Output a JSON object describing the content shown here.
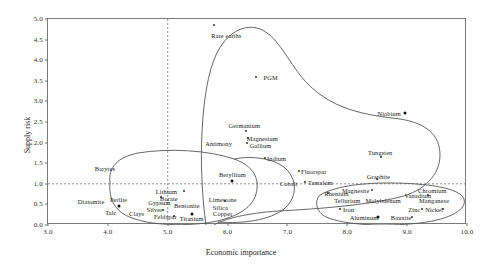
{
  "chart_data": {
    "type": "scatter",
    "title": "",
    "xlabel": "Economic importance",
    "ylabel": "Supply risk",
    "xlim": [
      3.0,
      10.0
    ],
    "ylim": [
      0.0,
      5.0
    ],
    "xticks": [
      "3.0",
      "4.0",
      "5.0",
      "6.0",
      "7.0",
      "8.0",
      "9.0",
      "10.0"
    ],
    "yticks": [
      "0.0",
      "0.5",
      "1.0",
      "1.5",
      "2.0",
      "2.5",
      "3.0",
      "3.5",
      "4.0",
      "4.5",
      "5.0"
    ],
    "grid": false,
    "legend": "none",
    "reference_lines": [
      {
        "name": "vertical-threshold",
        "axis": "x",
        "value": 5.0,
        "style": "dashed"
      },
      {
        "name": "horizontal-threshold",
        "axis": "y",
        "value": 1.0,
        "style": "dashed"
      }
    ],
    "points": [
      {
        "label": "Rare earths",
        "x": 5.78,
        "y": 4.85,
        "lx": 5.98,
        "ly": 4.6
      },
      {
        "label": "PGM",
        "x": 6.5,
        "y": 3.6,
        "lx": 6.72,
        "ly": 3.6
      },
      {
        "label": "Niobium",
        "x": 8.97,
        "y": 2.72,
        "lx": 8.7,
        "ly": 2.72
      },
      {
        "label": "Germanium",
        "x": 6.28,
        "y": 2.32,
        "lx": 6.28,
        "ly": 2.42
      },
      {
        "label": "Magnesium",
        "x": 6.35,
        "y": 2.12,
        "lx": 6.58,
        "ly": 2.12
      },
      {
        "label": "Gallium",
        "x": 6.32,
        "y": 1.97,
        "lx": 6.55,
        "ly": 1.94
      },
      {
        "label": "Antimony",
        "x": 5.95,
        "y": 1.98,
        "lx": 5.85,
        "ly": 1.98
      },
      {
        "label": "Indium",
        "x": 6.62,
        "y": 1.62,
        "lx": 6.82,
        "ly": 1.62
      },
      {
        "label": "Tungsten",
        "x": 8.55,
        "y": 1.72,
        "lx": 8.55,
        "ly": 1.78
      },
      {
        "label": "Fluorspar",
        "x": 7.22,
        "y": 1.32,
        "lx": 7.44,
        "ly": 1.32
      },
      {
        "label": "Beryllium",
        "x": 6.08,
        "y": 1.1,
        "lx": 6.08,
        "ly": 1.24
      },
      {
        "label": "Cobalt",
        "x": 7.08,
        "y": 1.02,
        "lx": 7.02,
        "ly": 1.02
      },
      {
        "label": "Tantalum",
        "x": 7.45,
        "y": 1.04,
        "lx": 7.55,
        "ly": 1.04
      },
      {
        "label": "Graphite",
        "x": 8.5,
        "y": 1.2,
        "lx": 8.52,
        "ly": 1.2
      },
      {
        "label": "Barytes",
        "x": 3.95,
        "y": 1.38,
        "lx": 3.95,
        "ly": 1.38
      },
      {
        "label": "Diatomite",
        "x": 3.72,
        "y": 0.58,
        "lx": 3.72,
        "ly": 0.58
      },
      {
        "label": "Perlite",
        "x": 4.18,
        "y": 0.52,
        "lx": 4.18,
        "ly": 0.62
      },
      {
        "label": "Talc",
        "x": 4.05,
        "y": 0.32,
        "lx": 4.05,
        "ly": 0.32
      },
      {
        "label": "Clays",
        "x": 4.48,
        "y": 0.3,
        "lx": 4.48,
        "ly": 0.3
      },
      {
        "label": "Lithium",
        "x": 5.12,
        "y": 0.82,
        "lx": 4.98,
        "ly": 0.82
      },
      {
        "label": "Borate",
        "x": 5.02,
        "y": 0.66,
        "lx": 5.02,
        "ly": 0.66
      },
      {
        "label": "Gypsum",
        "x": 4.86,
        "y": 0.55,
        "lx": 4.86,
        "ly": 0.55
      },
      {
        "label": "Bentonite",
        "x": 5.32,
        "y": 0.48,
        "lx": 5.32,
        "ly": 0.48
      },
      {
        "label": "Limestone",
        "x": 5.92,
        "y": 0.64,
        "lx": 5.92,
        "ly": 0.64
      },
      {
        "label": "Silica",
        "x": 5.88,
        "y": 0.44,
        "lx": 5.88,
        "ly": 0.44
      },
      {
        "label": "Silver",
        "x": 4.78,
        "y": 0.38,
        "lx": 4.78,
        "ly": 0.38
      },
      {
        "label": "Copper",
        "x": 5.92,
        "y": 0.3,
        "lx": 5.92,
        "ly": 0.3
      },
      {
        "label": "Feldspar",
        "x": 4.96,
        "y": 0.22,
        "lx": 4.96,
        "ly": 0.22
      },
      {
        "label": "Titanium",
        "x": 5.4,
        "y": 0.18,
        "lx": 5.4,
        "ly": 0.18
      },
      {
        "label": "Rhenium",
        "x": 7.78,
        "y": 0.78,
        "lx": 7.82,
        "ly": 0.78
      },
      {
        "label": "Magnesite",
        "x": 8.22,
        "y": 0.86,
        "lx": 8.14,
        "ly": 0.86
      },
      {
        "label": "Chromium",
        "x": 9.45,
        "y": 0.86,
        "lx": 9.42,
        "ly": 0.86
      },
      {
        "label": "Vanadium",
        "x": 9.18,
        "y": 0.7,
        "lx": 9.18,
        "ly": 0.72
      },
      {
        "label": "Manganese",
        "x": 9.45,
        "y": 0.6,
        "lx": 9.45,
        "ly": 0.6
      },
      {
        "label": "Tellurium",
        "x": 8.0,
        "y": 0.6,
        "lx": 8.0,
        "ly": 0.6
      },
      {
        "label": "Molybdenum",
        "x": 8.6,
        "y": 0.6,
        "lx": 8.6,
        "ly": 0.6
      },
      {
        "label": "Iron",
        "x": 8.0,
        "y": 0.38,
        "lx": 8.02,
        "ly": 0.38
      },
      {
        "label": "Zinc",
        "x": 9.12,
        "y": 0.4,
        "lx": 9.12,
        "ly": 0.4
      },
      {
        "label": "Nickel",
        "x": 9.48,
        "y": 0.38,
        "lx": 9.45,
        "ly": 0.38
      },
      {
        "label": "Aluminum",
        "x": 8.32,
        "y": 0.2,
        "lx": 8.28,
        "ly": 0.2
      },
      {
        "label": "Bauxite",
        "x": 8.92,
        "y": 0.2,
        "lx": 8.9,
        "ly": 0.2
      }
    ],
    "markers": [
      {
        "name": "rare-earths-marker",
        "x": 5.78,
        "y": 4.85,
        "size": "small"
      },
      {
        "name": "pgm-marker",
        "x": 6.48,
        "y": 3.6,
        "size": "small"
      },
      {
        "name": "niobium-marker",
        "x": 8.97,
        "y": 2.72,
        "size": "big"
      },
      {
        "name": "germanium-marker",
        "x": 6.3,
        "y": 2.28,
        "size": "small"
      },
      {
        "name": "magnesium-marker",
        "x": 6.34,
        "y": 2.12,
        "size": "small"
      },
      {
        "name": "gallium-marker",
        "x": 6.33,
        "y": 2.0,
        "size": "small"
      },
      {
        "name": "indium-marker",
        "x": 6.62,
        "y": 1.62,
        "size": "small"
      },
      {
        "name": "tungsten-marker",
        "x": 8.56,
        "y": 1.66,
        "size": "small"
      },
      {
        "name": "fluorspar-marker",
        "x": 7.2,
        "y": 1.32,
        "size": "small"
      },
      {
        "name": "beryllium-marker",
        "x": 6.08,
        "y": 1.08,
        "size": "big"
      },
      {
        "name": "tantalum-marker",
        "x": 7.3,
        "y": 1.04,
        "size": "small"
      },
      {
        "name": "graphite-marker",
        "x": 8.5,
        "y": 1.12,
        "size": "small"
      },
      {
        "name": "perlite-marker",
        "x": 4.18,
        "y": 0.46,
        "size": "big"
      },
      {
        "name": "lithium-marker",
        "x": 5.28,
        "y": 0.82,
        "size": "small"
      },
      {
        "name": "borate-marker",
        "x": 4.88,
        "y": 0.68,
        "size": "small"
      },
      {
        "name": "limestone-marker",
        "x": 5.95,
        "y": 0.58,
        "size": "small"
      },
      {
        "name": "silver-marker",
        "x": 4.92,
        "y": 0.36,
        "size": "small"
      },
      {
        "name": "titanium-marker",
        "x": 5.4,
        "y": 0.26,
        "size": "big"
      },
      {
        "name": "feldspar-marker",
        "x": 5.1,
        "y": 0.22,
        "size": "small"
      },
      {
        "name": "rhenium-marker",
        "x": 7.68,
        "y": 0.78,
        "size": "small"
      },
      {
        "name": "magnesite-marker",
        "x": 8.42,
        "y": 0.86,
        "size": "small"
      },
      {
        "name": "vanadium-marker",
        "x": 9.35,
        "y": 0.72,
        "size": "small"
      },
      {
        "name": "iron-marker",
        "x": 7.88,
        "y": 0.38,
        "size": "small"
      },
      {
        "name": "zinc-marker",
        "x": 9.25,
        "y": 0.4,
        "size": "small"
      },
      {
        "name": "nickel-marker",
        "x": 9.6,
        "y": 0.38,
        "size": "small"
      },
      {
        "name": "aluminum-marker",
        "x": 8.52,
        "y": 0.2,
        "size": "big"
      },
      {
        "name": "bauxite-marker",
        "x": 9.08,
        "y": 0.2,
        "size": "small"
      }
    ],
    "enclosures": [
      {
        "name": "critical-materials-outline"
      },
      {
        "name": "industrial-minerals-outline"
      },
      {
        "name": "bulk-metals-outline"
      }
    ]
  }
}
